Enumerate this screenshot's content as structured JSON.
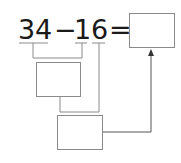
{
  "equation": {
    "tokens": [
      "3",
      "4",
      "−",
      "1",
      "6",
      "="
    ],
    "minuend": "34",
    "subtrahend": "16",
    "operator": "−",
    "equals": "="
  },
  "boxes": {
    "answer_box": "",
    "step1_box": "",
    "step2_box": ""
  },
  "colors": {
    "text": "#1a1a1a",
    "lines": "#8a8a8a",
    "background": "#ffffff"
  }
}
